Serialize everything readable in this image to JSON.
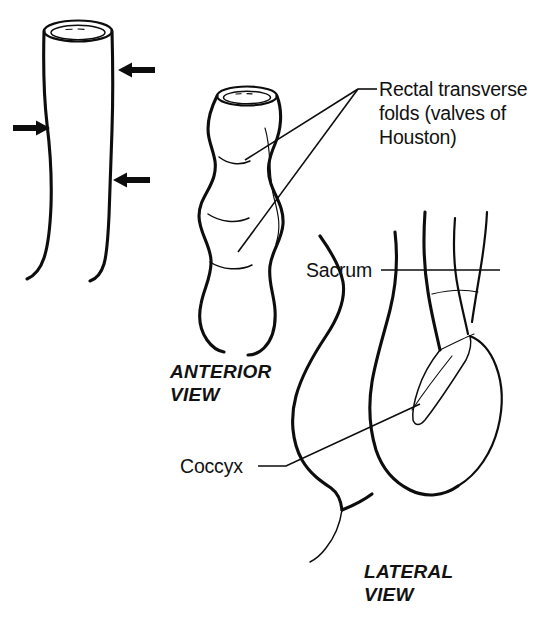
{
  "figure": {
    "background_color": "#ffffff",
    "ink_color": "#0d0d0d",
    "width": 544,
    "height": 631
  },
  "labels": {
    "folds": {
      "line1": "Rectal transverse",
      "line2": "folds (valves of",
      "line3": "Houston)"
    },
    "sacrum": "Sacrum",
    "coccyx": "Coccyx",
    "anterior_view": {
      "line1": "ANTERIOR",
      "line2": "VIEW"
    },
    "lateral_view": {
      "line1": "LATERAL",
      "line2": "VIEW"
    }
  },
  "panels": [
    {
      "name": "distended-rectum-tube",
      "description": "Smooth cylindrical rectum with open superior rim, compressed by three external arrows"
    },
    {
      "name": "anterior-view-rectum",
      "description": "Rectum in anterior view showing three transverse folds creating lateral bulges"
    },
    {
      "name": "lateral-view-rectum",
      "description": "Sagittal section of rectum with examining finger inserted, sacrum and coccyx indicated"
    }
  ],
  "arrows": [
    {
      "name": "arrow-upper-right",
      "direction": "left",
      "x": 118,
      "y": 70
    },
    {
      "name": "arrow-middle-left",
      "direction": "right",
      "x": 16,
      "y": 128
    },
    {
      "name": "arrow-lower-right",
      "direction": "left",
      "x": 113,
      "y": 180
    }
  ],
  "icons": {
    "arrow_left": "arrow-left-icon",
    "arrow_right": "arrow-right-icon"
  }
}
